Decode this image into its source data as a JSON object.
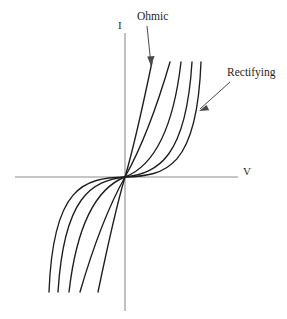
{
  "figure": {
    "name": "current-voltage-characteristic-diagram",
    "background_color": "#ffffff",
    "width": 287,
    "height": 319
  },
  "axes": {
    "vertical": {
      "label": "I",
      "name": "current-axis",
      "color": "#8d8d8d",
      "x": 125,
      "y_top": 33,
      "y_bottom": 311
    },
    "horizontal": {
      "label": "V",
      "name": "voltage-axis",
      "color": "#8d8d8d",
      "y": 177,
      "x_left": 15,
      "x_right": 238
    },
    "origin": {
      "x": 125,
      "y": 177
    }
  },
  "annotations": [
    {
      "label": "Ohmic",
      "name": "ohmic-annotation",
      "text_x": 137,
      "text_y": 11,
      "leader_from": [
        147,
        26
      ],
      "leader_to": [
        151,
        65
      ]
    },
    {
      "label": "Rectifying",
      "name": "rectifying-annotation",
      "text_x": 227,
      "text_y": 67,
      "leader_from": [
        230,
        82
      ],
      "leader_to": [
        200,
        109
      ]
    }
  ],
  "chart_data": {
    "type": "line",
    "title": "",
    "xlabel": "V",
    "ylabel": "I",
    "grid": false,
    "legend_position": "annotations",
    "xlim": [
      -1,
      1
    ],
    "ylim": [
      -1,
      1
    ],
    "curve_color": "#1d1d1d",
    "axis_color": "#8d8d8d",
    "series": [
      {
        "name": "curve-1-ohmic",
        "character": "ohmic",
        "annotated_by": "Ohmic",
        "path_q1": "M125,177 C133,150 142,110 152,62",
        "path_q3": "M125,177 C117,204 108,244 98,292"
      },
      {
        "name": "curve-2",
        "character": "near-ohmic",
        "path_q1": "M125,177 C139,152 156,110 170,62",
        "path_q3": "M125,177 C111,202 94,244 80,292"
      },
      {
        "name": "curve-3",
        "character": "intermediate",
        "path_q1": "M125,177 C148,168 172,140 181,62",
        "path_q3": "M125,177 C102,186 78,214 69,292"
      },
      {
        "name": "curve-4",
        "character": "rectifying",
        "path_q1": "M125,177 C158,173 186,158 192,62",
        "path_q3": "M125,177 C92,181 64,196 58,292"
      },
      {
        "name": "curve-5-rectifying",
        "character": "strongly-rectifying",
        "annotated_by": "Rectifying",
        "path_q1": "M125,177 C166,176 197,168 201,62",
        "path_q3": "M125,177 C84,178 53,186 49,292"
      }
    ]
  }
}
